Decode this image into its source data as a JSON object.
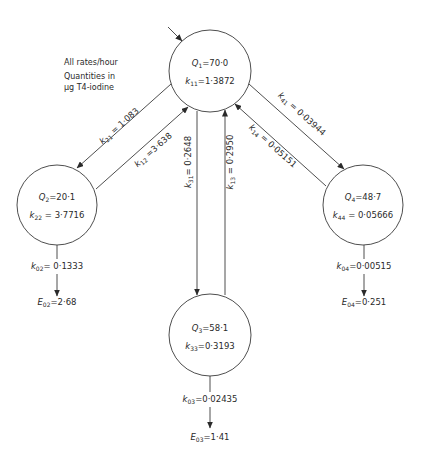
{
  "notes": {
    "line1": "All rates/hour",
    "line2": "Quantities in",
    "line3": "μg T4-iodine"
  },
  "compartments": [
    {
      "id": "Q1",
      "q_sym": "Q",
      "q_sub": "1",
      "q_val": "=70·0",
      "k_sym": "k",
      "k_sub": "11",
      "k_val": "=1·3872"
    },
    {
      "id": "Q2",
      "q_sym": "Q",
      "q_sub": "2",
      "q_val": "=20·1",
      "k_sym": "k",
      "k_sub": "22",
      "k_val": " = 3·7716"
    },
    {
      "id": "Q3",
      "q_sym": "Q",
      "q_sub": "3",
      "q_val": "=58·1",
      "k_sym": "k",
      "k_sub": "33",
      "k_val": "=0·3193"
    },
    {
      "id": "Q4",
      "q_sym": "Q",
      "q_sub": "4",
      "q_val": "=48·7",
      "k_sym": "k",
      "k_sub": "44",
      "k_val": " = 0·05666"
    }
  ],
  "transfers": {
    "k21": {
      "sym": "k",
      "sub": "21",
      "val": " = 1·083"
    },
    "k12": {
      "sym": "k",
      "sub": "12",
      "val": " =3·638"
    },
    "k31": {
      "sym": "k",
      "sub": "31",
      "val": "= 0·2648"
    },
    "k13": {
      "sym": "k",
      "sub": "13",
      "val": " = 0·2950"
    },
    "k41": {
      "sym": "k",
      "sub": "41",
      "val": " = 0·03944"
    },
    "k14": {
      "sym": "k",
      "sub": "14",
      "val": " = 0·05151"
    }
  },
  "outputs": {
    "k02": {
      "sym": "k",
      "sub": "02",
      "val": "= 0·1333"
    },
    "E02": {
      "sym": "E",
      "sub": "02",
      "val": "=2·68"
    },
    "k03": {
      "sym": "k",
      "sub": "03",
      "val": "=0·02435"
    },
    "E03": {
      "sym": "E",
      "sub": "03",
      "val": "=1·41"
    },
    "k04": {
      "sym": "k",
      "sub": "04",
      "val": "=0·00515"
    },
    "E04": {
      "sym": "E",
      "sub": "04",
      "val": "=0·251"
    }
  }
}
